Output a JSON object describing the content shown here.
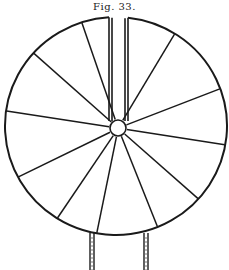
{
  "figure": {
    "caption": "Fig. 33.",
    "stroke_color": "#1a1a1a",
    "background": "#ffffff",
    "wheel": {
      "cx": 116,
      "cy": 126,
      "rx": 111,
      "ry": 109
    },
    "hub": {
      "cx": 118,
      "cy": 128,
      "r": 8
    },
    "spoke_angles_deg": [
      -58,
      -20,
      10,
      42,
      68,
      100,
      122,
      152,
      188,
      222,
      252
    ],
    "top_tube": {
      "x_left": [
        109,
        112
      ],
      "x_right": [
        125,
        128
      ],
      "y_top": 17,
      "y_bottom": 120
    },
    "bottom_tubes": [
      {
        "x1": 90,
        "x2": 94,
        "y_top": 233,
        "y_bottom": 270
      },
      {
        "x1": 144,
        "x2": 148,
        "y_top": 233,
        "y_bottom": 270
      }
    ]
  }
}
